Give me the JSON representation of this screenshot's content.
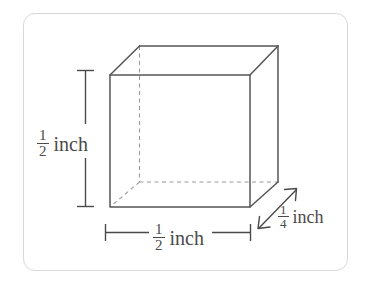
{
  "figure": {
    "type": "geometry-diagram",
    "shape": "rectangular-prism",
    "colors": {
      "border": "#d8d8d8",
      "solid_edge": "#555555",
      "hidden_edge": "#999999",
      "dimension_line": "#4a4a4a",
      "text": "#4a4a4a",
      "background": "#ffffff"
    },
    "labels": {
      "height": {
        "numerator": "1",
        "denominator": "2",
        "unit": "inch",
        "full_text": "1/2 inch",
        "position": "left"
      },
      "width": {
        "numerator": "1",
        "denominator": "2",
        "unit": "inch",
        "full_text": "1/2 inch",
        "position": "bottom"
      },
      "depth": {
        "numerator": "1",
        "denominator": "4",
        "unit": "inch",
        "full_text": "1/4 inch",
        "position": "bottom-right"
      }
    }
  }
}
